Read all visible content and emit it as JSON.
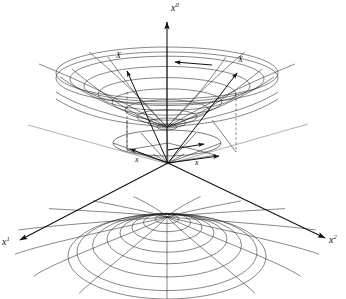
{
  "figure": {
    "kind": "minkowski-hyperboloid-diagram",
    "background_color": "#ffffff",
    "stroke_color": "#1a1a1a",
    "light_stroke_color": "#8c8c8c",
    "width": 346,
    "height": 299
  },
  "axes": [
    {
      "id": "x0",
      "base": "x",
      "sup": "0",
      "label": "x0",
      "direction": "up",
      "tip": [
        167,
        18
      ],
      "label_pos": [
        172,
        4
      ]
    },
    {
      "id": "x1",
      "base": "x",
      "sup": "1",
      "label": "x1",
      "direction": "down-left",
      "tip": [
        14,
        243
      ],
      "label_pos": [
        3,
        240
      ]
    },
    {
      "id": "x2",
      "base": "x",
      "sup": "2",
      "label": "x2",
      "direction": "down-right",
      "tip": [
        330,
        240
      ],
      "label_pos": [
        330,
        238
      ]
    }
  ],
  "vectors": [
    {
      "id": "upper-left-vector",
      "base": "X",
      "accent": "arrow",
      "label": "X",
      "label_pos": [
        118,
        56
      ],
      "tail": [
        127,
        92
      ],
      "tip": [
        124,
        67
      ]
    },
    {
      "id": "upper-right-vector",
      "base": "X",
      "accent": "arrow",
      "label": "X",
      "label_pos": [
        239,
        60
      ],
      "tail": [
        236,
        94
      ],
      "tip": [
        240,
        70
      ]
    },
    {
      "id": "lower-left-vector",
      "base": "x",
      "accent": "arrow",
      "label": "x",
      "label_pos": [
        137,
        160
      ],
      "tail": [
        168,
        163
      ],
      "tip": [
        131,
        150
      ]
    },
    {
      "id": "lower-right-vector",
      "base": "x",
      "accent": "arrow",
      "label": "x",
      "label_pos": [
        196,
        163
      ],
      "tail": [
        168,
        163
      ],
      "tip": [
        216,
        155
      ]
    }
  ],
  "surfaces": [
    {
      "id": "upper-sheet",
      "name": "upper-hyperboloid-sheet",
      "type": "bowl",
      "rim_center": [
        167,
        73
      ],
      "rim_rx": 111,
      "rim_ry": 26,
      "vertex": [
        167,
        127
      ],
      "u_lines": 24,
      "v_lines": 7
    },
    {
      "id": "lower-sheet",
      "name": "lower-hyperboloid-sheet",
      "type": "dome",
      "apex": [
        167,
        217
      ],
      "base_center": [
        167,
        252
      ],
      "base_rx": 95,
      "base_ry": 40,
      "u_lines": 24,
      "v_lines": 7
    },
    {
      "id": "light-cone",
      "name": "light-cone",
      "type": "cone",
      "apex": [
        167,
        163
      ],
      "rim_center": [
        167,
        143
      ],
      "rim_rx": 54,
      "rim_ry": 13
    }
  ],
  "plane_lines": [
    {
      "id": "plane-left",
      "from": [
        28,
        125
      ],
      "to": [
        168,
        164
      ]
    },
    {
      "id": "plane-right",
      "from": [
        308,
        124
      ],
      "to": [
        168,
        164
      ]
    }
  ],
  "origin": {
    "x": 167,
    "y": 163,
    "label": ""
  }
}
